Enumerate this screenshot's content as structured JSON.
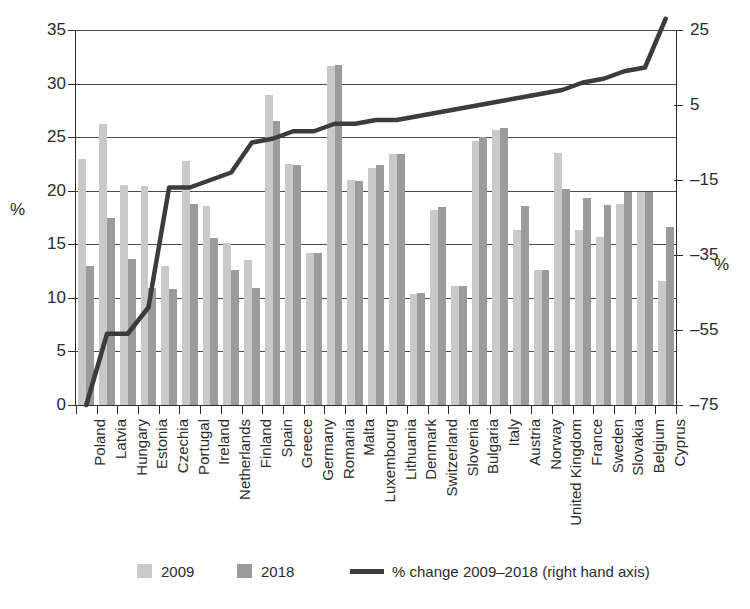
{
  "chart_data": {
    "type": "bar",
    "title": "",
    "subtitle": "",
    "xlabel": "",
    "ylabel": "%",
    "ylabel_right": "%",
    "ylim": [
      0,
      35
    ],
    "ylim_right": [
      -75,
      25
    ],
    "yticks": [
      0,
      5,
      10,
      15,
      20,
      25,
      30,
      35
    ],
    "yticks_right": [
      -75,
      -55,
      -35,
      -15,
      5,
      25
    ],
    "grid": true,
    "legend_position": "bottom",
    "categories": [
      "Poland",
      "Latvia",
      "Hungary",
      "Estonia",
      "Czechia",
      "Portugal",
      "Ireland",
      "Netherlands",
      "Finland",
      "Spain",
      "Greece",
      "Germany",
      "Romania",
      "Malta",
      "Luxembourg",
      "Lithuania",
      "Denmark",
      "Switzerland",
      "Slovenia",
      "Bulgaria",
      "Italy",
      "Austria",
      "Norway",
      "United Kingdom",
      "France",
      "Sweden",
      "Slovakia",
      "Belgium",
      "Cyprus"
    ],
    "series": [
      {
        "name": "2009",
        "color": "#c9c9c9",
        "axis": "left",
        "values": [
          23.0,
          26.2,
          20.5,
          20.4,
          13.0,
          22.8,
          18.6,
          15.1,
          13.5,
          28.9,
          22.5,
          14.2,
          31.6,
          21.0,
          22.1,
          23.4,
          10.4,
          18.2,
          11.1,
          24.6,
          25.7,
          16.3,
          12.6,
          23.5,
          16.3,
          15.7,
          18.8,
          19.9,
          11.6
        ]
      },
      {
        "name": "2018",
        "color": "#9b9b9b",
        "axis": "left",
        "values": [
          13.0,
          17.5,
          13.6,
          10.9,
          10.8,
          18.8,
          15.6,
          12.6,
          10.9,
          26.5,
          22.4,
          14.2,
          31.7,
          20.9,
          22.4,
          23.4,
          10.5,
          18.5,
          11.1,
          25.0,
          25.9,
          18.6,
          12.6,
          20.2,
          19.3,
          18.7,
          19.9,
          19.9,
          16.6
        ]
      }
    ],
    "line_series": {
      "name": "% change 2009–2018 (right hand axis)",
      "color": "#3c3c3c",
      "axis": "right",
      "values": [
        -75,
        -56,
        -56,
        -49,
        -17,
        -17,
        -15,
        -13,
        -5,
        -4,
        -2,
        -2,
        0,
        0,
        1,
        1,
        2,
        3,
        4,
        5,
        6,
        7,
        8,
        9,
        11,
        12,
        14,
        15,
        28
      ]
    }
  },
  "legend": {
    "items": [
      {
        "label": "2009",
        "type": "swatch",
        "color": "#c9c9c9"
      },
      {
        "label": "2018",
        "type": "swatch",
        "color": "#9b9b9b"
      },
      {
        "label": "% change 2009–2018 (right hand axis)",
        "type": "line",
        "color": "#3c3c3c"
      }
    ]
  }
}
